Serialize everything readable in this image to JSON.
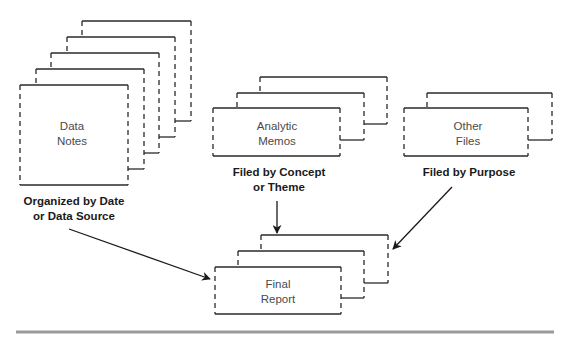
{
  "diagram": {
    "stacks": [
      {
        "id": "data-notes",
        "lines": [
          "Data",
          "Notes"
        ],
        "caption": [
          "Organized by Date",
          "or Data Source"
        ],
        "layers": [
          {
            "left": 20,
            "right": 128,
            "top": 85,
            "bottom": 185
          },
          {
            "left": 36,
            "right": 144,
            "top": 69,
            "bottom": 169
          },
          {
            "left": 51,
            "right": 159,
            "top": 53,
            "bottom": 153
          },
          {
            "left": 67,
            "right": 175,
            "top": 37,
            "bottom": 137
          },
          {
            "left": 82,
            "right": 191,
            "top": 21,
            "bottom": 121
          }
        ],
        "text_center": [
          72,
          126,
          141
        ],
        "caption_center": [
          74,
          201,
          216
        ]
      },
      {
        "id": "analytic-memos",
        "lines": [
          "Analytic",
          "Memos"
        ],
        "caption": [
          "Filed by Concept",
          "or Theme"
        ],
        "layers": [
          {
            "left": 213,
            "right": 340,
            "top": 108,
            "bottom": 156
          },
          {
            "left": 237,
            "right": 364,
            "top": 93,
            "bottom": 140
          },
          {
            "left": 260,
            "right": 387,
            "top": 77,
            "bottom": 124
          }
        ],
        "text_center": [
          277,
          126,
          141
        ],
        "caption_center": [
          279,
          172,
          187
        ]
      },
      {
        "id": "other-files",
        "lines": [
          "Other",
          "Files"
        ],
        "caption": [
          "Filed by Purpose"
        ],
        "layers": [
          {
            "left": 404,
            "right": 528,
            "top": 108,
            "bottom": 156
          },
          {
            "left": 427,
            "right": 552,
            "top": 93,
            "bottom": 140
          }
        ],
        "text_center": [
          468,
          126,
          141
        ],
        "caption_center": [
          469,
          172
        ]
      },
      {
        "id": "final-report",
        "lines": [
          "Final",
          "Report"
        ],
        "caption": [],
        "layers": [
          {
            "left": 215,
            "right": 341,
            "top": 267,
            "bottom": 314
          },
          {
            "left": 238,
            "right": 364,
            "top": 251,
            "bottom": 298
          },
          {
            "left": 261,
            "right": 388,
            "top": 235,
            "bottom": 283
          }
        ],
        "text_center": [
          278,
          284,
          299
        ]
      }
    ],
    "arrows": [
      {
        "id": "data-notes-to-final-report",
        "from": [
          69,
          229
        ],
        "to": [
          210,
          279
        ]
      },
      {
        "id": "memos-to-final-report",
        "from": [
          277,
          201
        ],
        "to": [
          277,
          233
        ]
      },
      {
        "id": "other-files-to-final-report",
        "from": [
          452,
          187
        ],
        "to": [
          393,
          249
        ]
      }
    ],
    "rule": {
      "x1": 16,
      "x2": 554,
      "y": 332,
      "color": "#9a9a9a"
    }
  }
}
